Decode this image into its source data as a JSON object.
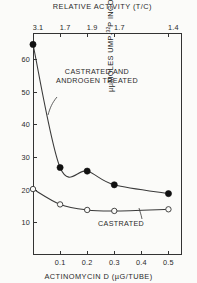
{
  "chart_data": {
    "type": "line",
    "title": "",
    "xlabel": "ACTINOMYCIN D (µG/TUBE)",
    "ylabel": "µµMOLES UMP-32P INCORPORATED/100 µG DNA",
    "top_axis_label": "RELATIVE ACTIVITY (T/C)",
    "xlim": [
      0.0,
      0.55
    ],
    "ylim": [
      0,
      68
    ],
    "x_ticks": [
      0.1,
      0.2,
      0.3,
      0.4,
      0.5
    ],
    "x_tick_labels": [
      "0.1",
      "0.2",
      "0.3",
      "0.4",
      "0.5"
    ],
    "y_ticks": [
      10,
      20,
      30,
      40,
      50,
      60
    ],
    "y_tick_labels": [
      "10",
      "20",
      "30",
      "40",
      "50",
      "60"
    ],
    "top_ticks": [
      0.0,
      0.1,
      0.2,
      0.3,
      0.5
    ],
    "top_tick_labels": [
      "3.1",
      "1.7",
      "1.9",
      "1.7",
      "1.4"
    ],
    "grid": false,
    "legend_position": "inline-annotations",
    "series": [
      {
        "name": "CASTRATED AND ANDROGEN TREATED",
        "marker": "filled-circle",
        "x": [
          0.0,
          0.1,
          0.2,
          0.3,
          0.5
        ],
        "values": [
          64.5,
          26.8,
          25.7,
          21.5,
          18.8
        ]
      },
      {
        "name": "CASTRATED",
        "marker": "open-circle",
        "x": [
          0.0,
          0.1,
          0.2,
          0.3,
          0.5
        ],
        "values": [
          20.2,
          15.5,
          13.8,
          13.5,
          14.0
        ]
      }
    ],
    "annotations": [
      {
        "text_line1": "CASTRATED AND",
        "text_line2": "ANDROGEN TREATED",
        "series": "CASTRATED AND ANDROGEN TREATED"
      },
      {
        "text_line1": "CASTRATED",
        "text_line2": "",
        "series": "CASTRATED"
      }
    ]
  },
  "axes": {
    "x_title": "ACTINOMYCIN D (µG/TUBE)",
    "top_title": "RELATIVE ACTIVITY (T/C)",
    "y_title_pre": "µµMOLES  UMP-",
    "y_title_sup": "32",
    "y_title_post": "P  INCORPORATED/100 µG DNA"
  },
  "labels": {
    "treated_l1": "CASTRATED AND",
    "treated_l2": "ANDROGEN TREATED",
    "castrated": "CASTRATED"
  }
}
